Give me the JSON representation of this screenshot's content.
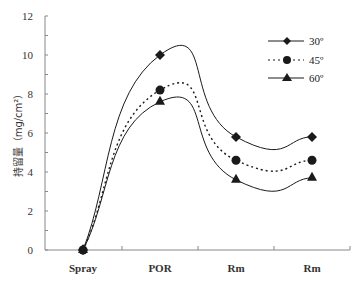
{
  "chart_data": {
    "type": "line",
    "title": "",
    "xlabel": "",
    "ylabel": "持留量（mg/cm²）",
    "categories": [
      "Spray",
      "POR",
      "Rm",
      "Rm"
    ],
    "ylim": [
      0,
      12
    ],
    "yticks": [
      0,
      2,
      4,
      6,
      8,
      10,
      12
    ],
    "grid": false,
    "legend_position": "upper right",
    "series": [
      {
        "name": "30°",
        "values": [
          0,
          10.0,
          5.8,
          5.8
        ],
        "marker": "diamond",
        "line": "solid"
      },
      {
        "name": "45°",
        "values": [
          0,
          8.2,
          4.6,
          4.6
        ],
        "marker": "circle",
        "line": "dotted"
      },
      {
        "name": "60°",
        "values": [
          0,
          7.6,
          3.6,
          3.7
        ],
        "marker": "triangle",
        "line": "solid"
      }
    ]
  },
  "axis": {
    "y_label": "持留量（mg/cm²）",
    "y_ticks": [
      "0",
      "2",
      "4",
      "6",
      "8",
      "10",
      "12"
    ],
    "x_ticks": [
      "Spray",
      "POR",
      "Rm",
      "Rm"
    ]
  },
  "legend": {
    "items": [
      {
        "label": "30º"
      },
      {
        "label": "45º"
      },
      {
        "label": "60º"
      }
    ]
  },
  "colors": {
    "line": "#1a1a1a",
    "axis": "#888888"
  }
}
